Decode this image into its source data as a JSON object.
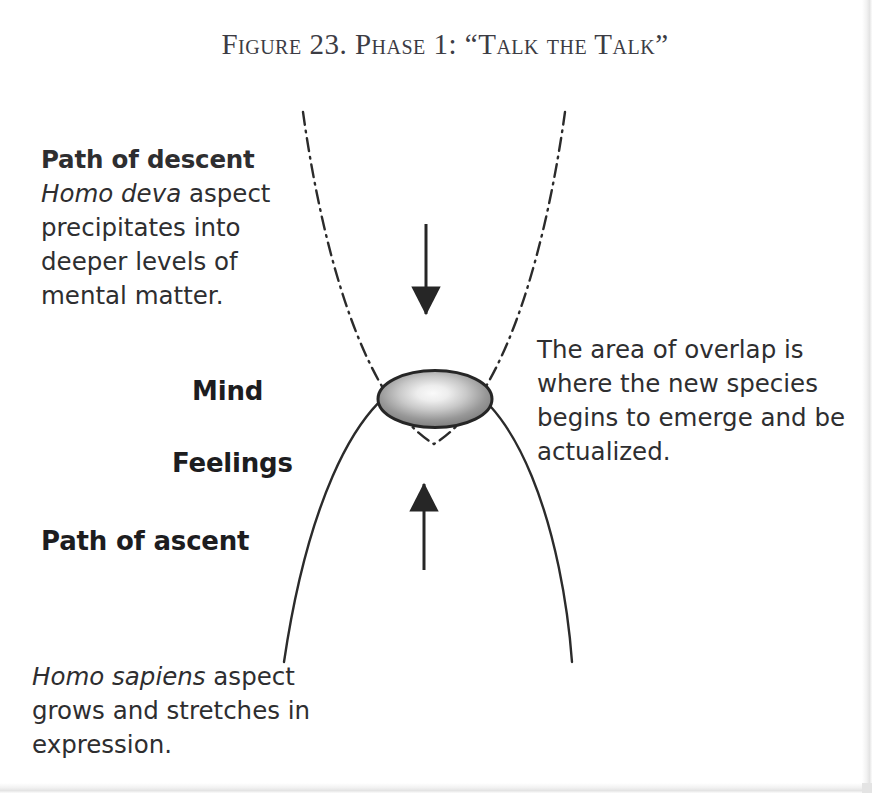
{
  "figure": {
    "title": "Figure 23. Phase 1:  “Talk the Talk”",
    "title_color": "#3c3c44",
    "background_color": "#ffffff"
  },
  "descent": {
    "heading": "Path of descent",
    "italic_term": "Homo deva",
    "body_rest": " aspect precipitates into deeper levels of mental matter."
  },
  "ascent": {
    "heading": "Path of ascent",
    "italic_term": "Homo sapiens",
    "body_rest": " aspect grows and stretches in expression."
  },
  "labels": {
    "mind": "Mind",
    "feelings": "Feelings"
  },
  "overlap": {
    "note": "The area of overlap is where the new species begins to emerge and be actualized."
  },
  "diagram": {
    "descent_curve_style": "dash-dot",
    "descent_curve_color": "#2b2b2b",
    "ascent_curve_style": "solid",
    "ascent_curve_color": "#2b2b2b",
    "arrow_down_name": "descent-arrow",
    "arrow_up_name": "ascent-arrow",
    "arrow_color": "#262626",
    "overlap_ellipse_outline": "#262626",
    "overlap_ellipse_center_color": "#f4f4f4",
    "overlap_ellipse_edge_color": "#7e7e7e"
  }
}
